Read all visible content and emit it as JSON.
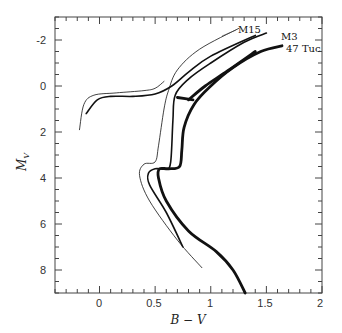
{
  "chart_data": {
    "type": "line",
    "title": "",
    "xlabel": "B − V",
    "ylabel": "M_V",
    "xlim": [
      -0.4,
      2.0
    ],
    "ylim": [
      9,
      -3
    ],
    "y_inverted": true,
    "grid": false,
    "legend": "direct labels at upper right",
    "x_ticks": [
      0,
      0.5,
      1,
      1.5,
      2
    ],
    "x_tick_labels": [
      "0",
      "0.5",
      "1",
      "1.5",
      "2"
    ],
    "y_ticks": [
      -2,
      0,
      2,
      4,
      6,
      8
    ],
    "y_tick_labels": [
      "-2",
      "0",
      "2",
      "4",
      "6",
      "8"
    ],
    "series": [
      {
        "name": "M15",
        "style": "thin",
        "segments": [
          {
            "part": "main sequence / subgiant / red giant branch",
            "points": [
              [
                0.92,
                7.9
              ],
              [
                0.7,
                6.7
              ],
              [
                0.45,
                5.0
              ],
              [
                0.36,
                3.9
              ],
              [
                0.4,
                3.4
              ],
              [
                0.5,
                3.3
              ],
              [
                0.53,
                2.6
              ],
              [
                0.58,
                1.0
              ],
              [
                0.62,
                0.2
              ],
              [
                0.7,
                -0.7
              ],
              [
                0.9,
                -1.6
              ],
              [
                1.25,
                -2.5
              ]
            ]
          },
          {
            "part": "horizontal branch",
            "points": [
              [
                -0.18,
                1.9
              ],
              [
                -0.14,
                0.8
              ],
              [
                -0.05,
                0.4
              ],
              [
                0.15,
                0.3
              ],
              [
                0.4,
                0.2
              ],
              [
                0.5,
                0.1
              ],
              [
                0.58,
                -0.2
              ]
            ]
          }
        ]
      },
      {
        "name": "M3",
        "style": "medium",
        "segments": [
          {
            "part": "main sequence / subgiant / red giant branch",
            "points": [
              [
                0.75,
                7.0
              ],
              [
                0.6,
                5.5
              ],
              [
                0.45,
                4.3
              ],
              [
                0.44,
                3.8
              ],
              [
                0.5,
                3.6
              ],
              [
                0.6,
                3.6
              ],
              [
                0.64,
                3.3
              ],
              [
                0.66,
                1.5
              ],
              [
                0.68,
                0.4
              ],
              [
                0.8,
                -0.3
              ],
              [
                1.0,
                -1.0
              ],
              [
                1.3,
                -1.9
              ],
              [
                1.5,
                -2.3
              ]
            ]
          },
          {
            "part": "horizontal branch / AGB",
            "points": [
              [
                -0.12,
                1.2
              ],
              [
                -0.02,
                0.6
              ],
              [
                0.1,
                0.45
              ],
              [
                0.3,
                0.45
              ],
              [
                0.5,
                0.35
              ],
              [
                0.65,
                0.0
              ],
              [
                0.8,
                -0.6
              ],
              [
                1.0,
                -1.3
              ],
              [
                1.4,
                -2.2
              ]
            ]
          }
        ]
      },
      {
        "name": "47 Tuc",
        "style": "thick",
        "segments": [
          {
            "part": "main sequence / subgiant / red giant branch",
            "points": [
              [
                1.31,
                9.0
              ],
              [
                1.2,
                8.0
              ],
              [
                1.05,
                7.2
              ],
              [
                0.8,
                6.3
              ],
              [
                0.6,
                5.0
              ],
              [
                0.53,
                4.0
              ],
              [
                0.54,
                3.6
              ],
              [
                0.62,
                3.6
              ],
              [
                0.72,
                3.5
              ],
              [
                0.74,
                2.8
              ],
              [
                0.76,
                1.8
              ],
              [
                0.85,
                0.8
              ],
              [
                1.0,
                0.0
              ],
              [
                1.2,
                -0.8
              ],
              [
                1.45,
                -1.5
              ],
              [
                1.64,
                -1.75
              ]
            ]
          },
          {
            "part": "red clump",
            "points": [
              [
                0.7,
                0.5
              ],
              [
                0.84,
                0.6
              ]
            ]
          },
          {
            "part": "asymptotic giant branch",
            "points": [
              [
                0.8,
                0.6
              ],
              [
                0.95,
                0.0
              ],
              [
                1.15,
                -0.65
              ],
              [
                1.4,
                -1.5
              ]
            ]
          }
        ]
      }
    ]
  },
  "labels": {
    "m15": "M15",
    "m3": "M3",
    "tuc47": "47 Tuc",
    "xlabel": "B − V",
    "ylabel_main": "M",
    "ylabel_sub": "V"
  },
  "ticks": {
    "x": [
      "0",
      "0.5",
      "1",
      "1.5",
      "2"
    ],
    "y": [
      "-2",
      "0",
      "2",
      "4",
      "6",
      "8"
    ]
  }
}
